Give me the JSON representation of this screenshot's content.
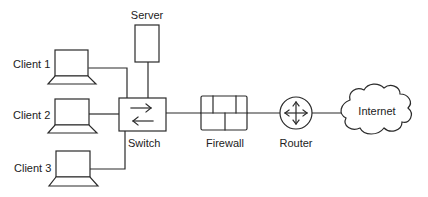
{
  "diagram": {
    "type": "network-topology",
    "nodes": {
      "client1": {
        "label": "Client 1",
        "kind": "laptop",
        "icon": "laptop-icon"
      },
      "client2": {
        "label": "Client 2",
        "kind": "laptop",
        "icon": "laptop-icon"
      },
      "client3": {
        "label": "Client 3",
        "kind": "laptop",
        "icon": "laptop-icon"
      },
      "server": {
        "label": "Server",
        "kind": "server",
        "icon": "server-icon"
      },
      "switch": {
        "label": "Switch",
        "kind": "switch",
        "icon": "switch-icon"
      },
      "firewall": {
        "label": "Firewall",
        "kind": "firewall",
        "icon": "brick-wall-icon"
      },
      "router": {
        "label": "Router",
        "kind": "router",
        "icon": "router-arrows-icon"
      },
      "internet": {
        "label": "Internet",
        "kind": "cloud",
        "icon": "cloud-icon"
      }
    },
    "edges": [
      {
        "from": "Client 1",
        "to": "Switch"
      },
      {
        "from": "Client 2",
        "to": "Switch"
      },
      {
        "from": "Client 3",
        "to": "Switch"
      },
      {
        "from": "Server",
        "to": "Switch"
      },
      {
        "from": "Switch",
        "to": "Firewall"
      },
      {
        "from": "Firewall",
        "to": "Router"
      },
      {
        "from": "Router",
        "to": "Internet"
      }
    ],
    "colors": {
      "stroke": "#2a2a2a",
      "text": "#222222",
      "background": "#ffffff"
    }
  }
}
